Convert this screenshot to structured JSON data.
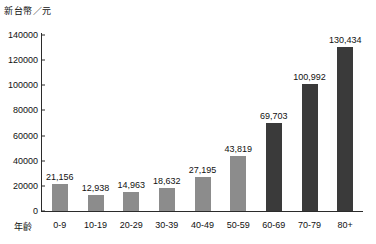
{
  "chart_data": {
    "type": "bar",
    "title": "",
    "subtitle": "",
    "ylabel": "新台幣／元",
    "xlabel": "年齡",
    "categories": [
      "0-9",
      "10-19",
      "20-29",
      "30-39",
      "40-49",
      "50-59",
      "60-69",
      "70-79",
      "80+"
    ],
    "values": [
      21156,
      12938,
      14963,
      18632,
      27195,
      43819,
      69703,
      100992,
      130434
    ],
    "value_labels": [
      "21,156",
      "12,938",
      "14,963",
      "18,632",
      "27,195",
      "43,819",
      "69,703",
      "100,992",
      "130,434"
    ],
    "bar_colors": [
      "#8c8c8c",
      "#8c8c8c",
      "#8c8c8c",
      "#8c8c8c",
      "#8c8c8c",
      "#8c8c8c",
      "#3a3a3a",
      "#3a3a3a",
      "#3a3a3a"
    ],
    "ylim": [
      0,
      140000
    ],
    "yticks": [
      0,
      20000,
      40000,
      60000,
      80000,
      100000,
      120000,
      140000
    ],
    "ytick_labels": [
      "0",
      "20000",
      "40000",
      "60000",
      "80000",
      "100000",
      "120000",
      "140000"
    ],
    "grid": false,
    "legend": "none",
    "axis_color": "#2b2b2b",
    "background": "#ffffff"
  }
}
